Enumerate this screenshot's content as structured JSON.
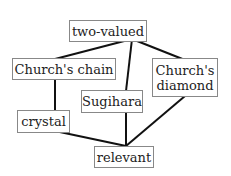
{
  "diagram": {
    "type": "hasse-diagram",
    "nodes": [
      {
        "id": "two-valued",
        "label": "two-valued"
      },
      {
        "id": "churchs-chain",
        "label": "Church's chain"
      },
      {
        "id": "churchs-diamond",
        "label": "Church's\ndiamond"
      },
      {
        "id": "sugihara",
        "label": "Sugihara"
      },
      {
        "id": "crystal",
        "label": "crystal"
      },
      {
        "id": "relevant",
        "label": "relevant"
      }
    ],
    "edges": [
      [
        "two-valued",
        "churchs-chain"
      ],
      [
        "two-valued",
        "sugihara"
      ],
      [
        "two-valued",
        "churchs-diamond"
      ],
      [
        "churchs-chain",
        "crystal"
      ],
      [
        "crystal",
        "relevant"
      ],
      [
        "sugihara",
        "relevant"
      ],
      [
        "churchs-diamond",
        "relevant"
      ]
    ]
  }
}
